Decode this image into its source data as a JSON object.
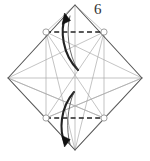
{
  "figure": {
    "step_label": "6",
    "colors": {
      "outline": "#555555",
      "crease": "#aaaaaa",
      "fold_line": "#222222",
      "arrow": "#222222",
      "marker_stroke": "#888888",
      "background": "#ffffff",
      "step_number": "#333333"
    },
    "canvas": {
      "width": 150,
      "height": 161
    },
    "outline_shape": {
      "name": "diamond",
      "vertices": [
        {
          "name": "top",
          "x": 75,
          "y": 5
        },
        {
          "name": "right",
          "x": 142,
          "y": 78
        },
        {
          "name": "bottom",
          "x": 75,
          "y": 150
        },
        {
          "name": "left",
          "x": 8,
          "y": 78
        }
      ]
    },
    "reference_points": [
      {
        "name": "upper-left-marker",
        "x": 46,
        "y": 32
      },
      {
        "name": "upper-right-marker",
        "x": 104,
        "y": 32
      },
      {
        "name": "lower-left-marker",
        "x": 46,
        "y": 118
      },
      {
        "name": "lower-right-marker",
        "x": 104,
        "y": 118
      }
    ],
    "fold_lines": [
      {
        "name": "top-valley-fold",
        "style": "dashed",
        "x1": 46,
        "y1": 32,
        "x2": 104,
        "y2": 32
      },
      {
        "name": "bottom-valley-fold",
        "style": "dashed",
        "x1": 46,
        "y1": 118,
        "x2": 104,
        "y2": 118
      }
    ],
    "crease_lines": [
      {
        "name": "horizontal-center-crease",
        "x1": 8,
        "y1": 78,
        "x2": 142,
        "y2": 78
      },
      {
        "name": "vertical-center-crease",
        "x1": 75,
        "y1": 5,
        "x2": 75,
        "y2": 150
      },
      {
        "name": "inner-square-top-left",
        "x1": 46,
        "y1": 32,
        "x2": 75,
        "y2": 5
      },
      {
        "name": "inner-square-left-edge",
        "x1": 46,
        "y1": 32,
        "x2": 46,
        "y2": 118
      },
      {
        "name": "inner-square-right-edge",
        "x1": 104,
        "y1": 32,
        "x2": 104,
        "y2": 118
      },
      {
        "name": "diagonal-ul-to-lr",
        "x1": 46,
        "y1": 32,
        "x2": 104,
        "y2": 118
      },
      {
        "name": "diagonal-ur-to-ll",
        "x1": 104,
        "y1": 32,
        "x2": 46,
        "y2": 118
      },
      {
        "name": "left-vertex-to-upper-right",
        "x1": 8,
        "y1": 78,
        "x2": 104,
        "y2": 32
      },
      {
        "name": "left-vertex-to-lower-right",
        "x1": 8,
        "y1": 78,
        "x2": 104,
        "y2": 118
      },
      {
        "name": "right-vertex-to-upper-left",
        "x1": 142,
        "y1": 78,
        "x2": 46,
        "y2": 32
      },
      {
        "name": "right-vertex-to-lower-left",
        "x1": 142,
        "y1": 78,
        "x2": 46,
        "y2": 118
      },
      {
        "name": "ul-marker-to-bottom-vertex",
        "x1": 46,
        "y1": 32,
        "x2": 75,
        "y2": 150
      },
      {
        "name": "ur-marker-to-bottom-vertex",
        "x1": 104,
        "y1": 32,
        "x2": 75,
        "y2": 150
      },
      {
        "name": "ll-marker-to-right-vertex",
        "x1": 46,
        "y1": 118,
        "x2": 142,
        "y2": 78
      },
      {
        "name": "lr-marker-to-left-vertex",
        "x1": 104,
        "y1": 118,
        "x2": 8,
        "y2": 78
      },
      {
        "name": "left-vertex-to-ll-marker",
        "x1": 8,
        "y1": 78,
        "x2": 46,
        "y2": 118
      },
      {
        "name": "right-vertex-to-lr-marker",
        "x1": 142,
        "y1": 78,
        "x2": 104,
        "y2": 118
      }
    ],
    "arrows": [
      {
        "name": "top-fold-arrow",
        "direction": "up",
        "description": "curved arrow sweeping upward above the top valley fold",
        "path": "M 77 68 C 63 52 61 30 65 15",
        "head": "M 65 15 L 62 25 L 71 22 Z"
      },
      {
        "name": "bottom-fold-arrow",
        "direction": "down",
        "description": "curved arrow sweeping downward below the bottom valley fold",
        "path": "M 73 92 C 60 108 60 130 65 145",
        "head": "M 65 145 L 61 134 L 70 137 Z"
      }
    ]
  }
}
